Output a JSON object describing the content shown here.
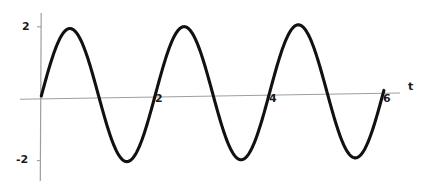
{
  "chart_data": {
    "type": "line",
    "title": "",
    "subtitle": "",
    "xlabel": "t",
    "ylabel": "",
    "function": "2*sin(pi*t)",
    "amplitude": 2,
    "period": 2,
    "xlim": [
      -0.1,
      6.2
    ],
    "ylim": [
      -2.35,
      2.35
    ],
    "grid": false,
    "legend": null,
    "legend_position": "none",
    "x_ticks": [
      2,
      4,
      6
    ],
    "x_tick_labels": [
      "2",
      "4",
      "6"
    ],
    "y_ticks": [
      2,
      -2
    ],
    "y_tick_labels": [
      "2",
      "-2"
    ],
    "line_color": "#000000",
    "axis_color": "#9a9a9a",
    "background_color": "#ffffff",
    "peaks": [
      {
        "t": 0.5,
        "value": 2
      },
      {
        "t": 2.5,
        "value": 2
      },
      {
        "t": 4.5,
        "value": 2
      }
    ],
    "troughs": [
      {
        "t": 1.5,
        "value": -2
      },
      {
        "t": 3.5,
        "value": -2
      },
      {
        "t": 5.5,
        "value": -2
      }
    ],
    "zero_crossings": [
      0,
      1,
      2,
      3,
      4,
      5,
      6
    ],
    "x": [
      0,
      0.1,
      0.2,
      0.3,
      0.4,
      0.5,
      0.6,
      0.7,
      0.8,
      0.9,
      1.0,
      1.1,
      1.2,
      1.3,
      1.4,
      1.5,
      1.6,
      1.7,
      1.8,
      1.9,
      2.0,
      2.1,
      2.2,
      2.3,
      2.4,
      2.5,
      2.6,
      2.7,
      2.8,
      2.9,
      3.0,
      3.1,
      3.2,
      3.3,
      3.4,
      3.5,
      3.6,
      3.7,
      3.8,
      3.9,
      4.0,
      4.1,
      4.2,
      4.3,
      4.4,
      4.5,
      4.6,
      4.7,
      4.8,
      4.9,
      5.0,
      5.1,
      5.2,
      5.3,
      5.4,
      5.5,
      5.6,
      5.7,
      5.8,
      5.9,
      6.0
    ],
    "y": [
      0.0,
      0.62,
      1.18,
      1.62,
      1.9,
      2.0,
      1.9,
      1.62,
      1.18,
      0.62,
      0.0,
      -0.62,
      -1.18,
      -1.62,
      -1.9,
      -2.0,
      -1.9,
      -1.62,
      -1.18,
      -0.62,
      0.0,
      0.62,
      1.18,
      1.62,
      1.9,
      2.0,
      1.9,
      1.62,
      1.18,
      0.62,
      0.0,
      -0.62,
      -1.18,
      -1.62,
      -1.9,
      -2.0,
      -1.9,
      -1.62,
      -1.18,
      -0.62,
      0.0,
      0.62,
      1.18,
      1.62,
      1.9,
      2.0,
      1.9,
      1.62,
      1.18,
      0.62,
      0.0,
      -0.62,
      -1.18,
      -1.62,
      -1.9,
      -2.0,
      -1.9,
      -1.62,
      -1.18,
      -0.62,
      0.0
    ]
  },
  "labels": {
    "y_top": "2",
    "y_bottom": "-2",
    "x_tick_2": "2",
    "x_tick_4": "4",
    "x_tick_6": "6",
    "x_axis_name": "t"
  }
}
